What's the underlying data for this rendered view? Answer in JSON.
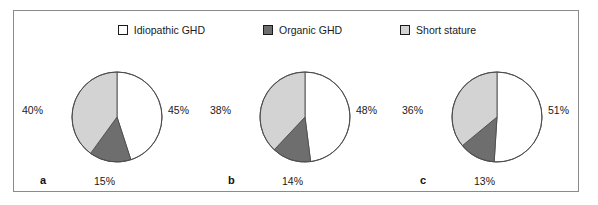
{
  "figure": {
    "background": "#ffffff",
    "frame_color": "#8a8a8a"
  },
  "legend": {
    "position": "top-center",
    "items": [
      {
        "label": "Idiopathic GHD",
        "color": "#ffffff",
        "swatch": "white-square-swatch"
      },
      {
        "label": "Organic GHD",
        "color": "#6e6e6e",
        "swatch": "dark-gray-square-swatch"
      },
      {
        "label": "Short stature",
        "color": "#d3d3d3",
        "swatch": "light-gray-square-swatch"
      }
    ]
  },
  "chart_data": [
    {
      "type": "pie",
      "title": "a",
      "panel_letter": "a",
      "categories": [
        "Idiopathic GHD",
        "Organic GHD",
        "Short stature"
      ],
      "values": [
        45,
        15,
        40
      ],
      "labels": [
        "45%",
        "15%",
        "40%"
      ],
      "colors": [
        "#ffffff",
        "#6e6e6e",
        "#d3d3d3"
      ],
      "start_angle_deg": 0,
      "direction": "clockwise",
      "units": "percent"
    },
    {
      "type": "pie",
      "title": "b",
      "panel_letter": "b",
      "categories": [
        "Idiopathic GHD",
        "Organic GHD",
        "Short stature"
      ],
      "values": [
        48,
        14,
        38
      ],
      "labels": [
        "48%",
        "14%",
        "38%"
      ],
      "colors": [
        "#ffffff",
        "#6e6e6e",
        "#d3d3d3"
      ],
      "start_angle_deg": 0,
      "direction": "clockwise",
      "units": "percent"
    },
    {
      "type": "pie",
      "title": "c",
      "panel_letter": "c",
      "categories": [
        "Idiopathic GHD",
        "Organic GHD",
        "Short stature"
      ],
      "values": [
        51,
        13,
        36
      ],
      "labels": [
        "51%",
        "13%",
        "36%"
      ],
      "colors": [
        "#ffffff",
        "#6e6e6e",
        "#d3d3d3"
      ],
      "start_angle_deg": 0,
      "direction": "clockwise",
      "units": "percent"
    }
  ]
}
